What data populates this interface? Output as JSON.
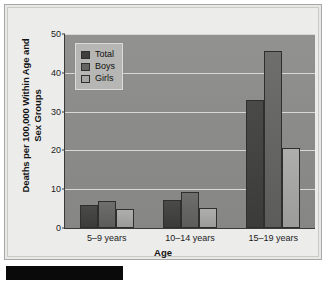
{
  "figure": {
    "background_color": "#ececeb",
    "plot_background_color": "#8e8e8c"
  },
  "legend": {
    "position": "top-left-inside",
    "items": [
      {
        "label": "Total",
        "color": "#3f3f3d",
        "swatch_name": "legend-swatch-total"
      },
      {
        "label": "Boys",
        "color": "#646462",
        "swatch_name": "legend-swatch-boys"
      },
      {
        "label": "Girls",
        "color": "#a5a5a3",
        "swatch_name": "legend-swatch-girls"
      }
    ]
  },
  "axes": {
    "y_title": "Deaths per 100,000 Within Age and Sex Groups",
    "x_title": "Age",
    "y_ticks": [
      "0",
      "10",
      "20",
      "30",
      "40",
      "50"
    ],
    "x_ticks": [
      "5–9 years",
      "10–14 years",
      "15–19 years"
    ]
  },
  "caption_bar": {
    "visible": true,
    "color": "#0a0a0a"
  },
  "chart_data": {
    "type": "bar",
    "title": "",
    "xlabel": "Age",
    "ylabel": "Deaths per 100,000 Within Age and Sex Groups",
    "categories": [
      "5–9 years",
      "10–14 years",
      "15–19 years"
    ],
    "series": [
      {
        "name": "Total",
        "color": "#3f3f3d",
        "values": [
          6.0,
          7.3,
          33.0
        ]
      },
      {
        "name": "Boys",
        "color": "#646462",
        "values": [
          7.0,
          9.2,
          45.5
        ]
      },
      {
        "name": "Girls",
        "color": "#a5a5a3",
        "values": [
          5.0,
          5.2,
          20.5
        ]
      }
    ],
    "ylim": [
      0,
      50
    ],
    "ytick_values": [
      0,
      10,
      20,
      30,
      40,
      50
    ],
    "grid": true,
    "grid_axis": "y",
    "legend_position": "upper left"
  }
}
